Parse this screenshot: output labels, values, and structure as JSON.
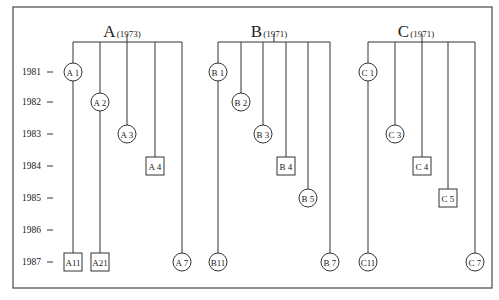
{
  "diagram": {
    "frame": {
      "x": 13,
      "y": 7,
      "width": 479,
      "height": 281
    },
    "years": [
      {
        "label": "1981",
        "y": 72
      },
      {
        "label": "1982",
        "y": 102
      },
      {
        "label": "1983",
        "y": 134
      },
      {
        "label": "1984",
        "y": 166
      },
      {
        "label": "1985",
        "y": 198
      },
      {
        "label": "1986",
        "y": 230
      },
      {
        "label": "1987",
        "y": 262
      }
    ],
    "bracket_y": 42,
    "groups": [
      {
        "id": "A",
        "letter": "A",
        "year": "(1973)",
        "stem_x": 127,
        "label_x": 122,
        "branches": [
          {
            "x": 73,
            "nodes": [
              {
                "label": "A 1",
                "shape": "circle",
                "year": "1981"
              },
              {
                "label": "A11",
                "shape": "square",
                "year": "1987"
              }
            ]
          },
          {
            "x": 100,
            "nodes": [
              {
                "label": "A 2",
                "shape": "circle",
                "year": "1982"
              },
              {
                "label": "A21",
                "shape": "square",
                "year": "1987"
              }
            ]
          },
          {
            "x": 127,
            "nodes": [
              {
                "label": "A 3",
                "shape": "circle",
                "year": "1983"
              }
            ]
          },
          {
            "x": 155,
            "nodes": [
              {
                "label": "A 4",
                "shape": "square",
                "year": "1984"
              }
            ]
          },
          {
            "x": 182,
            "nodes": [
              {
                "label": "A 7",
                "shape": "circle",
                "year": "1987"
              }
            ]
          }
        ]
      },
      {
        "id": "B",
        "letter": "B",
        "year": "(1971)",
        "stem_x": 274,
        "label_x": 269,
        "branches": [
          {
            "x": 218,
            "nodes": [
              {
                "label": "B 1",
                "shape": "circle",
                "year": "1981"
              },
              {
                "label": "B11",
                "shape": "circle",
                "year": "1987"
              }
            ]
          },
          {
            "x": 241,
            "nodes": [
              {
                "label": "B 2",
                "shape": "circle",
                "year": "1982"
              }
            ]
          },
          {
            "x": 263,
            "nodes": [
              {
                "label": "B 3",
                "shape": "circle",
                "year": "1983"
              }
            ]
          },
          {
            "x": 286,
            "nodes": [
              {
                "label": "B 4",
                "shape": "square",
                "year": "1984"
              }
            ]
          },
          {
            "x": 308,
            "nodes": [
              {
                "label": "B 5",
                "shape": "circle",
                "year": "1985"
              }
            ]
          },
          {
            "x": 330,
            "nodes": [
              {
                "label": "B 7",
                "shape": "circle",
                "year": "1987"
              }
            ]
          }
        ]
      },
      {
        "id": "C",
        "letter": "C",
        "year": "(1971)",
        "stem_x": 422,
        "label_x": 416,
        "branches": [
          {
            "x": 368,
            "nodes": [
              {
                "label": "C 1",
                "shape": "circle",
                "year": "1981"
              },
              {
                "label": "C11",
                "shape": "circle",
                "year": "1987"
              }
            ]
          },
          {
            "x": 395,
            "nodes": [
              {
                "label": "C 3",
                "shape": "circle",
                "year": "1983"
              }
            ]
          },
          {
            "x": 422,
            "nodes": [
              {
                "label": "C 4",
                "shape": "square",
                "year": "1984"
              }
            ]
          },
          {
            "x": 448,
            "nodes": [
              {
                "label": "C 5",
                "shape": "square",
                "year": "1985"
              }
            ]
          },
          {
            "x": 475,
            "nodes": [
              {
                "label": "C 7",
                "shape": "circle",
                "year": "1987"
              }
            ]
          }
        ]
      }
    ]
  },
  "caption": {
    "text": "Fig. 13.2 ..."
  }
}
